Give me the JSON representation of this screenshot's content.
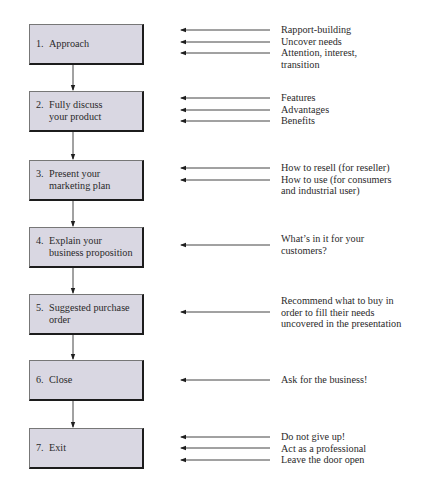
{
  "steps": [
    {
      "number": "1.",
      "label": "Approach",
      "notes": [
        "Rapport-building",
        "Uncover needs",
        "Attention, interest,\ntransition"
      ]
    },
    {
      "number": "2.",
      "label": "Fully discuss\nyour product",
      "notes": [
        "Features",
        "Advantages",
        "Benefits"
      ]
    },
    {
      "number": "3.",
      "label": "Present your\nmarketing plan",
      "notes": [
        "How to resell (for reseller)",
        "How to use (for consumers\nand industrial user)"
      ]
    },
    {
      "number": "4.",
      "label": "Explain your\nbusiness proposition",
      "notes": [
        "What’s in it for your\ncustomers?"
      ]
    },
    {
      "number": "5.",
      "label": "Suggested purchase\norder",
      "notes": [
        "Recommend what to buy in\norder to fill their needs\nuncovered in the presentation"
      ]
    },
    {
      "number": "6.",
      "label": "Close",
      "notes": [
        "Ask for the business!"
      ]
    },
    {
      "number": "7.",
      "label": "Exit",
      "notes": [
        "Do not give up!",
        "Act as a professional",
        "Leave the door open"
      ]
    }
  ],
  "colors": {
    "box_fill": "#d9d7e2",
    "line": "#2a2a2a"
  }
}
